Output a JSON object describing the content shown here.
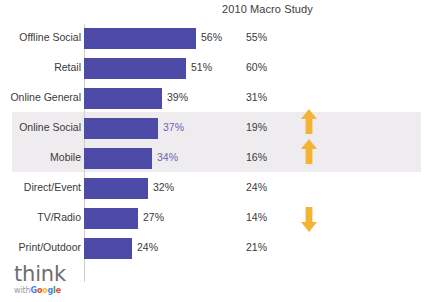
{
  "chart_data": {
    "type": "bar",
    "title": "2010 Macro Study",
    "xlabel": "",
    "ylabel": "",
    "xlim": [
      0,
      60
    ],
    "grid": false,
    "legend": "none",
    "orientation": "horizontal",
    "categories": [
      "Offline Social",
      "Retail",
      "Online General",
      "Online Social",
      "Mobile",
      "Direct/Event",
      "TV/Radio",
      "Print/Outdoor"
    ],
    "series": [
      {
        "name": "Current",
        "values": [
          56,
          51,
          39,
          37,
          34,
          32,
          27,
          24
        ],
        "labels": [
          "56%",
          "51%",
          "39%",
          "37%",
          "34%",
          "32%",
          "27%",
          "24%"
        ]
      },
      {
        "name": "2010 Macro Study",
        "values": [
          55,
          60,
          31,
          19,
          16,
          24,
          14,
          21
        ],
        "labels": [
          "55%",
          "60%",
          "31%",
          "19%",
          "16%",
          "24%",
          "14%",
          "21%"
        ]
      }
    ],
    "trend_annotations": [
      "",
      "",
      "",
      "up",
      "up",
      "",
      "down",
      ""
    ],
    "highlighted_categories": [
      "Online Social",
      "Mobile"
    ]
  },
  "rows": [
    {
      "label": "Offline Social",
      "bar_label": "56%",
      "bar_value": 56,
      "macro": "55%",
      "trend": "none",
      "highlighted": false
    },
    {
      "label": "Retail",
      "bar_label": "51%",
      "bar_value": 51,
      "macro": "60%",
      "trend": "none",
      "highlighted": false
    },
    {
      "label": "Online General",
      "bar_label": "39%",
      "bar_value": 39,
      "macro": "31%",
      "trend": "none",
      "highlighted": false
    },
    {
      "label": "Online Social",
      "bar_label": "37%",
      "bar_value": 37,
      "macro": "19%",
      "trend": "up",
      "highlighted": true
    },
    {
      "label": "Mobile",
      "bar_label": "34%",
      "bar_value": 34,
      "macro": "16%",
      "trend": "up",
      "highlighted": true
    },
    {
      "label": "Direct/Event",
      "bar_label": "32%",
      "bar_value": 32,
      "macro": "24%",
      "trend": "none",
      "highlighted": false
    },
    {
      "label": "TV/Radio",
      "bar_label": "27%",
      "bar_value": 27,
      "macro": "14%",
      "trend": "down",
      "highlighted": false
    },
    {
      "label": "Print/Outdoor",
      "bar_label": "24%",
      "bar_value": 24,
      "macro": "21%",
      "trend": "none",
      "highlighted": false
    }
  ],
  "logo": {
    "think": "think",
    "with": "with",
    "google": "Google"
  },
  "colors": {
    "bar": "#4d4aa8",
    "highlight_band": "#eeecef",
    "highlight_text": "#6b66b2",
    "arrow": "#f5b335",
    "text": "#3a3a3a",
    "axis": "#cfcfcf"
  }
}
